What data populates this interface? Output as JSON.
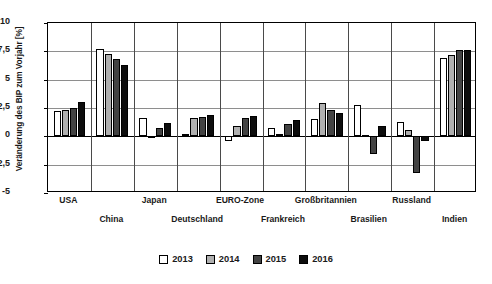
{
  "chart_data": {
    "type": "bar",
    "title": "",
    "xlabel": "",
    "ylabel": "Veränderung des BIP zum Vorjahr [%]",
    "ylim": [
      -5,
      10
    ],
    "yticks": [
      10,
      7.5,
      5,
      2.5,
      0,
      -2.5,
      -5
    ],
    "ytick_labels": [
      "10",
      "7,5",
      "5",
      "2,5",
      "0",
      "-2,5",
      "-5"
    ],
    "grid": true,
    "legend_position": "bottom",
    "categories": [
      "USA",
      "China",
      "Japan",
      "Deutschland",
      "EURO-Zone",
      "Frankreich",
      "Großbritannien",
      "Brasilien",
      "Russland",
      "Indien"
    ],
    "series": [
      {
        "name": "2013",
        "color": "#ffffff",
        "values": [
          2.2,
          7.7,
          1.6,
          0.2,
          -0.4,
          0.7,
          1.5,
          2.8,
          1.3,
          6.9
        ]
      },
      {
        "name": "2014",
        "color": "#b0b0b0",
        "values": [
          2.3,
          7.3,
          0.0,
          1.6,
          0.9,
          0.2,
          2.9,
          0.1,
          0.6,
          7.2
        ]
      },
      {
        "name": "2015",
        "color": "#434343",
        "values": [
          2.5,
          6.8,
          0.7,
          1.7,
          1.6,
          1.1,
          2.3,
          -1.6,
          -3.2,
          7.6
        ]
      },
      {
        "name": "2016",
        "color": "#0d0d0d",
        "values": [
          3.0,
          6.3,
          1.2,
          1.9,
          1.8,
          1.4,
          2.1,
          0.9,
          -0.4,
          7.6
        ]
      }
    ]
  },
  "legend": {
    "items": [
      {
        "label": "2013"
      },
      {
        "label": "2014"
      },
      {
        "label": "2015"
      },
      {
        "label": "2016"
      }
    ]
  }
}
